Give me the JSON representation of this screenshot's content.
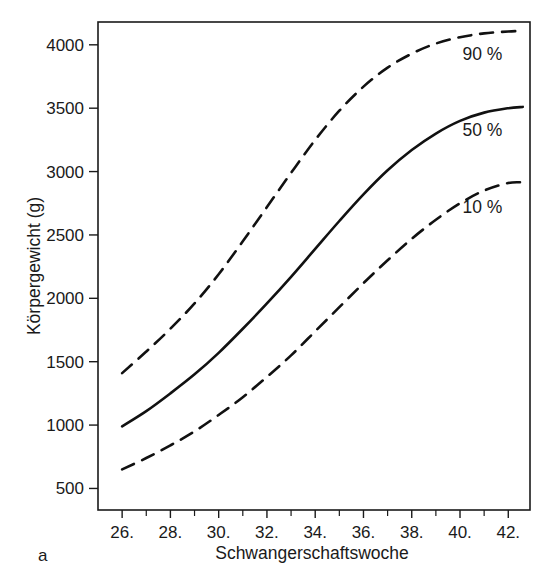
{
  "figure": {
    "panel_label": "a",
    "background_color": "#ffffff",
    "line_color": "#111111"
  },
  "chart_data": {
    "type": "line",
    "title": "",
    "subtitle": "",
    "xlabel": "Schwangerschaftswoche",
    "ylabel": "Körpergewicht (g)",
    "xlim": [
      25.0,
      42.9
    ],
    "ylim": [
      330,
      4180
    ],
    "grid": false,
    "legend_position": "inline-right",
    "x_tick_labels": [
      "26.",
      "28.",
      "30.",
      "32.",
      "34.",
      "36.",
      "38.",
      "40.",
      "42."
    ],
    "x_tick_values": [
      26,
      28,
      30,
      32,
      34,
      36,
      38,
      40,
      42
    ],
    "x_minor_tick_values": [
      27,
      29,
      31,
      33,
      35,
      37,
      39,
      41
    ],
    "y_tick_labels": [
      "500",
      "1000",
      "1500",
      "2000",
      "2500",
      "3000",
      "3500",
      "4000"
    ],
    "y_tick_values": [
      500,
      1000,
      1500,
      2000,
      2500,
      3000,
      3500,
      4000
    ],
    "x": [
      26,
      27,
      28,
      29,
      30,
      31,
      32,
      33,
      34,
      35,
      36,
      37,
      38,
      39,
      40,
      41,
      42,
      42.6
    ],
    "series": [
      {
        "name": "90 %",
        "label": "90 %",
        "style": "dashed",
        "color": "#111111",
        "values": [
          1410,
          1580,
          1760,
          1960,
          2190,
          2450,
          2720,
          2990,
          3250,
          3480,
          3670,
          3820,
          3930,
          4010,
          4060,
          4090,
          4105,
          4110
        ]
      },
      {
        "name": "50 %",
        "label": "50 %",
        "style": "solid",
        "color": "#111111",
        "values": [
          990,
          1110,
          1250,
          1400,
          1570,
          1760,
          1960,
          2170,
          2390,
          2610,
          2820,
          3010,
          3170,
          3300,
          3400,
          3465,
          3500,
          3510
        ]
      },
      {
        "name": "10 %",
        "label": "10 %",
        "style": "dashed",
        "color": "#111111",
        "values": [
          650,
          740,
          840,
          950,
          1080,
          1220,
          1380,
          1550,
          1740,
          1930,
          2120,
          2300,
          2470,
          2620,
          2750,
          2850,
          2910,
          2915
        ]
      }
    ],
    "series_label_positions": [
      {
        "label": "90 %",
        "x": 40.1,
        "y": 3880
      },
      {
        "label": "50 %",
        "x": 40.1,
        "y": 3280
      },
      {
        "label": "10 %",
        "x": 40.1,
        "y": 2670
      }
    ]
  }
}
